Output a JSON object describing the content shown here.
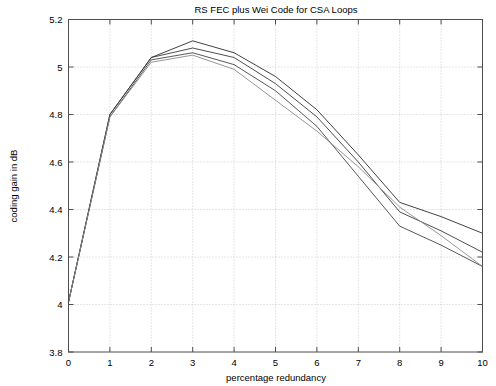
{
  "chart_data": {
    "type": "line",
    "title": "RS FEC plus Wei Code for CSA Loops",
    "xlabel": "percentage redundancy",
    "ylabel": "coding gain in dB",
    "xlim": [
      0,
      10
    ],
    "ylim": [
      3.8,
      5.2
    ],
    "xticks": [
      "0",
      "1",
      "2",
      "3",
      "4",
      "5",
      "6",
      "7",
      "8",
      "9",
      "10"
    ],
    "yticks": [
      "3.8",
      "4",
      "4.2",
      "4.4",
      "4.6",
      "4.8",
      "5",
      "5.2"
    ],
    "grid": true,
    "legend": "none",
    "x": [
      0,
      1,
      2,
      3,
      4,
      5,
      6,
      7,
      8,
      9,
      10
    ],
    "series": [
      {
        "name": "curve-1",
        "color": "#2b2b2b",
        "values": [
          4.01,
          4.8,
          5.04,
          5.11,
          5.06,
          4.96,
          4.82,
          4.63,
          4.43,
          4.37,
          4.3
        ]
      },
      {
        "name": "curve-2",
        "color": "#3a3a3a",
        "values": [
          4.01,
          4.8,
          5.04,
          5.08,
          5.04,
          4.93,
          4.79,
          4.6,
          4.39,
          4.31,
          4.22
        ]
      },
      {
        "name": "curve-3",
        "color": "#454545",
        "values": [
          4.01,
          4.79,
          5.03,
          5.06,
          5.01,
          4.9,
          4.75,
          4.54,
          4.33,
          4.25,
          4.16
        ]
      },
      {
        "name": "curve-4",
        "color": "#8a8a8a",
        "values": [
          4.01,
          4.79,
          5.02,
          5.05,
          4.99,
          4.86,
          4.73,
          4.58,
          4.41,
          4.29,
          4.16
        ]
      }
    ]
  },
  "figure": {
    "background_color": "#ffffff",
    "axis_color": "#4d4d4d",
    "grid_color": "#b9b9b9"
  }
}
